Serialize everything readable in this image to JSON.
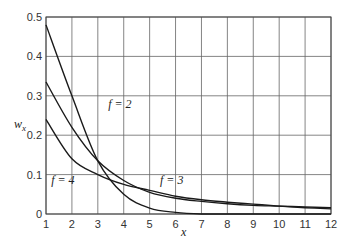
{
  "chart_data": {
    "type": "line",
    "title": "",
    "xlabel": "x",
    "ylabel": "w_x",
    "xlim": [
      1,
      12
    ],
    "ylim": [
      0,
      0.5
    ],
    "grid": true,
    "legend": "inline labels",
    "x_ticks": [
      "1",
      "2",
      "3",
      "4",
      "5",
      "6",
      "7",
      "8",
      "9",
      "10",
      "11",
      "12"
    ],
    "y_ticks": [
      "0",
      "0.1",
      "0.2",
      "0.3",
      "0.4",
      "0.5"
    ],
    "x": [
      1,
      2,
      3,
      4,
      5,
      6,
      7,
      8,
      9,
      10,
      11,
      12
    ],
    "series": [
      {
        "name": "f = 2",
        "values": [
          0.48,
          0.3,
          0.135,
          0.05,
          0.015,
          0.004,
          0.0,
          0.0,
          0.0,
          0.0,
          0.0,
          0.0
        ]
      },
      {
        "name": "f = 3",
        "values": [
          0.335,
          0.22,
          0.135,
          0.085,
          0.055,
          0.04,
          0.032,
          0.026,
          0.022,
          0.02,
          0.018,
          0.016
        ]
      },
      {
        "name": "f = 4",
        "values": [
          0.24,
          0.14,
          0.1,
          0.075,
          0.06,
          0.045,
          0.036,
          0.03,
          0.025,
          0.02,
          0.016,
          0.013
        ]
      }
    ],
    "annotations": [
      {
        "text": "f = 2",
        "x": 3.4,
        "y": 0.27
      },
      {
        "text": "f = 3",
        "x": 5.4,
        "y": 0.075
      },
      {
        "text": "f = 4",
        "x": 1.2,
        "y": 0.075
      }
    ]
  }
}
